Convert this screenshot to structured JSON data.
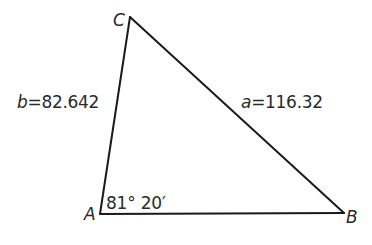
{
  "diagram": {
    "type": "triangle",
    "vertices": {
      "A": {
        "label": "A",
        "x": 100,
        "y": 214
      },
      "B": {
        "label": "B",
        "x": 344,
        "y": 213
      },
      "C": {
        "label": "C",
        "x": 130,
        "y": 17
      }
    },
    "sides": {
      "a": {
        "variable": "a",
        "equals": "=",
        "value": "116.32",
        "between": [
          "B",
          "C"
        ]
      },
      "b": {
        "variable": "b",
        "equals": "=",
        "value": "82.642",
        "between": [
          "A",
          "C"
        ]
      },
      "c": {
        "between": [
          "A",
          "B"
        ]
      }
    },
    "angle_A": {
      "label": "81° 20′"
    },
    "colors": {
      "line": "#1a1a1a",
      "text": "#2a2a2a",
      "background": "#ffffff"
    }
  }
}
